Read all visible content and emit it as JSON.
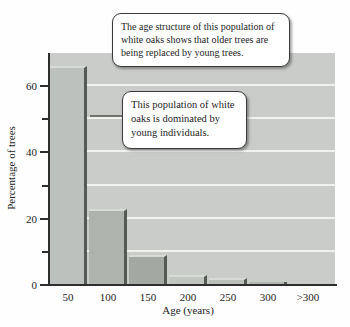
{
  "chart_data": {
    "type": "bar",
    "title": "",
    "categories": [
      "50",
      "100",
      "150",
      "200",
      "250",
      "300",
      ">300"
    ],
    "values": [
      66,
      23,
      9,
      3,
      2,
      1,
      0.3
    ],
    "xlabel": "Age (years)",
    "ylabel": "Percentage of trees",
    "ylim": [
      0,
      70
    ],
    "yticks_major": [
      0,
      20,
      40,
      60
    ],
    "yticks_minor": [
      10,
      30,
      50
    ],
    "gridlines": [
      10,
      20,
      30,
      40,
      50,
      60
    ],
    "grid": true,
    "legend": "none"
  },
  "annotations": {
    "callout_top": {
      "text": "The age structure of this population of white oaks shows that older trees are being replaced by young trees."
    },
    "callout_left": {
      "text": "This population of white oaks is dominated by young individuals."
    }
  },
  "colors": {
    "plot_bg": "#c9ccc8",
    "gridline": "#f0f2ee",
    "axis": "#2e2e2e",
    "bar_edge_dark": "#565a56",
    "bar_edge_light": "#d8dbd5",
    "bar_fills": [
      "#bdc1bd",
      "#aeb3ae",
      "#a3a8a3",
      "#c2c6c0",
      "#bbbfb9",
      "#b2b6b0",
      "#c5c8c2"
    ],
    "callout_bg": "#ffffff",
    "callout_border": "#3a3a3a",
    "leader_line": "#6f746f"
  }
}
